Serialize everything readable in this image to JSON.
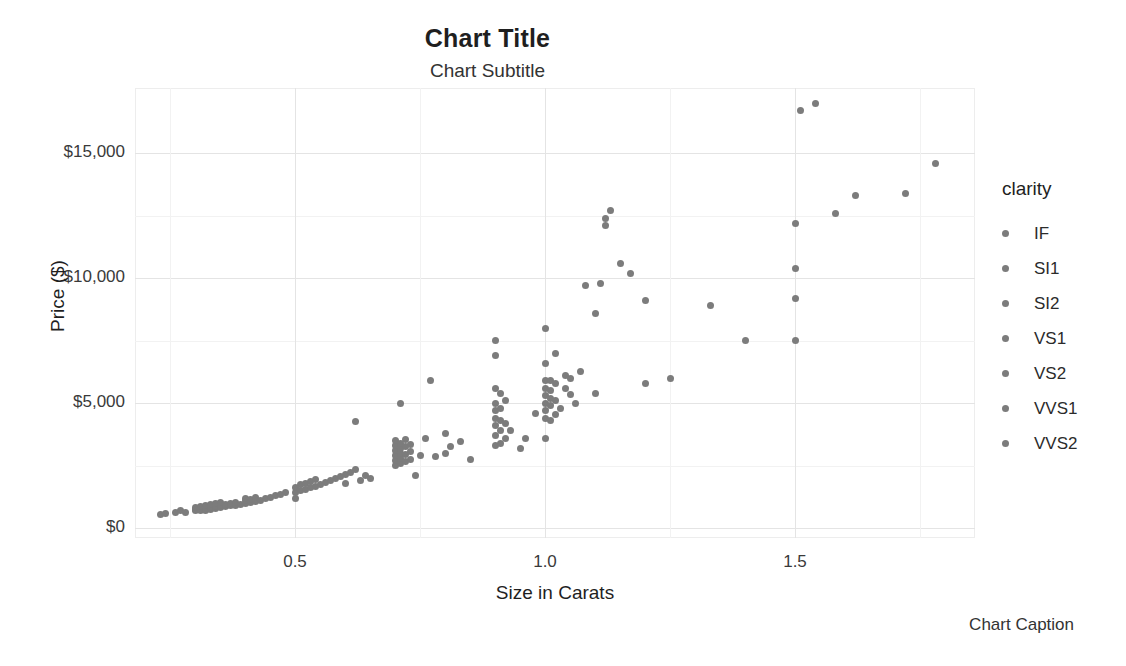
{
  "chart_data": {
    "type": "scatter",
    "title": "Chart Title",
    "subtitle": "Chart Subtitle",
    "caption": "Chart Caption",
    "xlabel": "Size in Carats",
    "ylabel": "Price ($)",
    "xlim": [
      0.18,
      1.86
    ],
    "ylim": [
      -400,
      17600
    ],
    "grid": true,
    "legend_position": "right",
    "legend_title": "clarity",
    "legend_entries": [
      "IF",
      "SI1",
      "SI2",
      "VS1",
      "VS2",
      "VVS1",
      "VVS2"
    ],
    "point_color": "#7c7c7c",
    "x_ticks": [
      0.5,
      1.0,
      1.5
    ],
    "x_tick_labels": [
      "0.5",
      "1.0",
      "1.5"
    ],
    "y_ticks": [
      0,
      5000,
      10000,
      15000
    ],
    "y_tick_labels": [
      "$0",
      "$5,000",
      "$10,000",
      "$15,000"
    ],
    "x_minor_ticks": [
      0.25,
      0.75,
      1.25,
      1.75
    ],
    "y_minor_ticks": [
      2500,
      7500,
      12500
    ],
    "series_name": "diamonds",
    "points": [
      [
        0.23,
        560
      ],
      [
        0.24,
        600
      ],
      [
        0.26,
        640
      ],
      [
        0.27,
        700
      ],
      [
        0.28,
        620
      ],
      [
        0.3,
        700
      ],
      [
        0.3,
        760
      ],
      [
        0.3,
        820
      ],
      [
        0.31,
        700
      ],
      [
        0.31,
        760
      ],
      [
        0.31,
        880
      ],
      [
        0.32,
        720
      ],
      [
        0.32,
        800
      ],
      [
        0.32,
        900
      ],
      [
        0.33,
        760
      ],
      [
        0.33,
        840
      ],
      [
        0.33,
        940
      ],
      [
        0.34,
        800
      ],
      [
        0.34,
        880
      ],
      [
        0.34,
        980
      ],
      [
        0.35,
        820
      ],
      [
        0.35,
        900
      ],
      [
        0.35,
        1010
      ],
      [
        0.36,
        860
      ],
      [
        0.36,
        960
      ],
      [
        0.37,
        900
      ],
      [
        0.37,
        1000
      ],
      [
        0.38,
        920
      ],
      [
        0.38,
        1040
      ],
      [
        0.39,
        960
      ],
      [
        0.4,
        1000
      ],
      [
        0.4,
        1100
      ],
      [
        0.4,
        1180
      ],
      [
        0.41,
        1040
      ],
      [
        0.41,
        1160
      ],
      [
        0.42,
        1080
      ],
      [
        0.42,
        1240
      ],
      [
        0.43,
        1120
      ],
      [
        0.44,
        1180
      ],
      [
        0.45,
        1220
      ],
      [
        0.46,
        1300
      ],
      [
        0.47,
        1360
      ],
      [
        0.48,
        1420
      ],
      [
        0.5,
        1180
      ],
      [
        0.5,
        1420
      ],
      [
        0.5,
        1620
      ],
      [
        0.51,
        1500
      ],
      [
        0.51,
        1740
      ],
      [
        0.52,
        1560
      ],
      [
        0.52,
        1800
      ],
      [
        0.53,
        1620
      ],
      [
        0.53,
        1880
      ],
      [
        0.54,
        1680
      ],
      [
        0.54,
        1960
      ],
      [
        0.55,
        1740
      ],
      [
        0.56,
        1820
      ],
      [
        0.57,
        1900
      ],
      [
        0.58,
        1980
      ],
      [
        0.59,
        2060
      ],
      [
        0.6,
        1780
      ],
      [
        0.6,
        2140
      ],
      [
        0.61,
        2240
      ],
      [
        0.62,
        2340
      ],
      [
        0.62,
        4250
      ],
      [
        0.63,
        1900
      ],
      [
        0.64,
        2120
      ],
      [
        0.65,
        1980
      ],
      [
        0.7,
        2500
      ],
      [
        0.7,
        2700
      ],
      [
        0.7,
        2900
      ],
      [
        0.7,
        3100
      ],
      [
        0.7,
        3300
      ],
      [
        0.7,
        3500
      ],
      [
        0.71,
        2600
      ],
      [
        0.71,
        2800
      ],
      [
        0.71,
        3000
      ],
      [
        0.71,
        3200
      ],
      [
        0.71,
        3400
      ],
      [
        0.71,
        5000
      ],
      [
        0.72,
        2650
      ],
      [
        0.72,
        2950
      ],
      [
        0.72,
        3250
      ],
      [
        0.72,
        3550
      ],
      [
        0.73,
        2750
      ],
      [
        0.73,
        3050
      ],
      [
        0.73,
        3350
      ],
      [
        0.74,
        2100
      ],
      [
        0.75,
        2900
      ],
      [
        0.76,
        3600
      ],
      [
        0.77,
        5900
      ],
      [
        0.78,
        2850
      ],
      [
        0.8,
        3000
      ],
      [
        0.8,
        3800
      ],
      [
        0.81,
        3250
      ],
      [
        0.83,
        3450
      ],
      [
        0.85,
        2750
      ],
      [
        0.9,
        3300
      ],
      [
        0.9,
        3700
      ],
      [
        0.9,
        4100
      ],
      [
        0.9,
        4400
      ],
      [
        0.9,
        4700
      ],
      [
        0.9,
        5000
      ],
      [
        0.9,
        5600
      ],
      [
        0.9,
        6900
      ],
      [
        0.9,
        7500
      ],
      [
        0.91,
        3400
      ],
      [
        0.91,
        3900
      ],
      [
        0.91,
        4300
      ],
      [
        0.91,
        4800
      ],
      [
        0.91,
        5400
      ],
      [
        0.92,
        3600
      ],
      [
        0.92,
        4200
      ],
      [
        0.92,
        5100
      ],
      [
        0.93,
        3900
      ],
      [
        0.95,
        3200
      ],
      [
        0.96,
        3600
      ],
      [
        0.98,
        4600
      ],
      [
        1.0,
        3600
      ],
      [
        1.0,
        4400
      ],
      [
        1.0,
        4700
      ],
      [
        1.0,
        5000
      ],
      [
        1.0,
        5300
      ],
      [
        1.0,
        5600
      ],
      [
        1.0,
        5900
      ],
      [
        1.0,
        6600
      ],
      [
        1.0,
        8000
      ],
      [
        1.01,
        4300
      ],
      [
        1.01,
        4900
      ],
      [
        1.01,
        5200
      ],
      [
        1.01,
        5500
      ],
      [
        1.01,
        5900
      ],
      [
        1.02,
        4550
      ],
      [
        1.02,
        5100
      ],
      [
        1.02,
        5800
      ],
      [
        1.02,
        7000
      ],
      [
        1.03,
        4800
      ],
      [
        1.04,
        5600
      ],
      [
        1.04,
        6100
      ],
      [
        1.05,
        5350
      ],
      [
        1.05,
        6000
      ],
      [
        1.06,
        5000
      ],
      [
        1.07,
        6250
      ],
      [
        1.08,
        9700
      ],
      [
        1.1,
        5400
      ],
      [
        1.1,
        8600
      ],
      [
        1.11,
        9800
      ],
      [
        1.12,
        12100
      ],
      [
        1.12,
        12400
      ],
      [
        1.13,
        12700
      ],
      [
        1.15,
        10600
      ],
      [
        1.17,
        10200
      ],
      [
        1.2,
        5800
      ],
      [
        1.2,
        9100
      ],
      [
        1.25,
        6000
      ],
      [
        1.33,
        8900
      ],
      [
        1.4,
        7500
      ],
      [
        1.5,
        7500
      ],
      [
        1.5,
        9200
      ],
      [
        1.5,
        10400
      ],
      [
        1.5,
        12200
      ],
      [
        1.51,
        16700
      ],
      [
        1.54,
        17000
      ],
      [
        1.58,
        12600
      ],
      [
        1.62,
        13300
      ],
      [
        1.72,
        13400
      ],
      [
        1.78,
        14600
      ]
    ]
  }
}
